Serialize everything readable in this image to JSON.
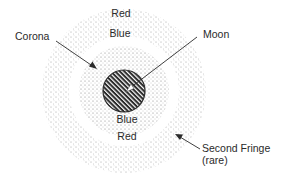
{
  "diagram": {
    "type": "corona-diagram",
    "colors": {
      "dots": "#6f6f6f",
      "moon_fill": "#2b2b2b",
      "moon_hatch": "#ffffff",
      "lines": "#2a2a2a",
      "text": "#2a2a2a"
    },
    "labels": {
      "corona": "Corona",
      "moon": "Moon",
      "outer_top_red": "Red",
      "outer_top_blue": "Blue",
      "inner_bottom_blue": "Blue",
      "outer_bottom_red": "Red",
      "second_fringe": "Second Fringe",
      "rare": "(rare)"
    },
    "geometry": {
      "moon_center": [
        124,
        91
      ],
      "moon_radius": 21,
      "inner_corona_radius": 45,
      "outer_ring_inner_radius": 55,
      "outer_ring_outer_radius": 82
    }
  }
}
